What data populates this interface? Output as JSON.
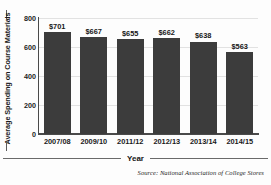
{
  "chart_data": {
    "type": "bar",
    "title": "",
    "subtitle": "",
    "xlabel": "Year",
    "ylabel": "Average Spending on Course Materials",
    "categories": [
      "2007/08",
      "2009/10",
      "2011/12",
      "2012/13",
      "2013/14",
      "2014/15"
    ],
    "values": [
      701,
      667,
      655,
      662,
      638,
      563
    ],
    "data_labels": [
      "$701",
      "$667",
      "$655",
      "$662",
      "$638",
      "$563"
    ],
    "ylim": [
      0,
      800
    ],
    "yticks": [
      0,
      200,
      400,
      600,
      800
    ],
    "ytick_labels": [
      "0",
      "200",
      "400",
      "600",
      "800"
    ],
    "grid": true,
    "legend": "none",
    "bar_color": "#3c3c3c",
    "value_prefix": "$",
    "series": [
      {
        "name": "Average Spending on Course Materials",
        "values": [
          701,
          667,
          655,
          662,
          638,
          563
        ]
      }
    ]
  },
  "annotations": {
    "source": "Source: National Association of College Stores",
    "source_label": "Source:",
    "source_text": "National Association of College Stores"
  },
  "colors": {
    "bar": "#3c3c3c",
    "axis": "#4a4a4a",
    "grid": "#e2e2e2",
    "text": "#1a1a1a",
    "background": "#fdfdfd"
  }
}
